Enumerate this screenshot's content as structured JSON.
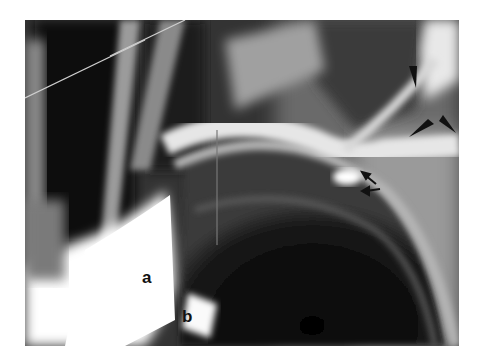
{
  "figure": {
    "type": "radiograph",
    "labels": {
      "a": "a",
      "b": "b"
    },
    "annotations": {
      "arrowheads": 4,
      "arrows": 2
    },
    "colors": {
      "background": "#ffffff",
      "dark_field": "#0a0a0a",
      "bright_structure": "#f5f5f5",
      "marker": "#111111"
    }
  }
}
